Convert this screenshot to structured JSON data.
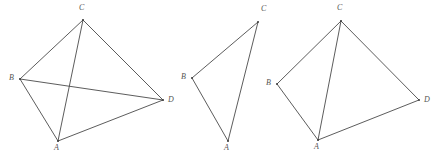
{
  "image": {
    "width": 442,
    "height": 158,
    "background_color": "#ffffff",
    "stroke_color": "#4a4a4a",
    "label_color": "#555555"
  },
  "figures": [
    {
      "id": "figure-1",
      "shape": "quadrilateral-with-two-diagonals",
      "vertices": [
        {
          "label": "C",
          "x": 83,
          "y": 20,
          "label_x": 79,
          "label_y": 4
        },
        {
          "label": "B",
          "x": 20,
          "y": 79,
          "label_x": 9,
          "label_y": 74
        },
        {
          "label": "D",
          "x": 163,
          "y": 100,
          "label_x": 168,
          "label_y": 96
        },
        {
          "label": "A",
          "x": 58,
          "y": 141,
          "label_x": 54,
          "label_y": 144
        }
      ],
      "edges": [
        {
          "from": "B",
          "to": "C",
          "kind": "side"
        },
        {
          "from": "C",
          "to": "D",
          "kind": "side"
        },
        {
          "from": "D",
          "to": "A",
          "kind": "side"
        },
        {
          "from": "A",
          "to": "B",
          "kind": "side"
        },
        {
          "from": "B",
          "to": "D",
          "kind": "diagonal"
        },
        {
          "from": "C",
          "to": "A",
          "kind": "diagonal"
        }
      ]
    },
    {
      "id": "figure-2",
      "shape": "triangle",
      "vertices": [
        {
          "label": "C",
          "x": 258,
          "y": 22,
          "label_x": 261,
          "label_y": 5
        },
        {
          "label": "B",
          "x": 192,
          "y": 78,
          "label_x": 181,
          "label_y": 73
        },
        {
          "label": "A",
          "x": 228,
          "y": 141,
          "label_x": 224,
          "label_y": 144
        }
      ],
      "edges": [
        {
          "from": "B",
          "to": "C",
          "kind": "side"
        },
        {
          "from": "B",
          "to": "A",
          "kind": "side"
        },
        {
          "from": "A",
          "to": "C",
          "kind": "side"
        }
      ]
    },
    {
      "id": "figure-3",
      "shape": "quadrilateral-with-one-diagonal",
      "vertices": [
        {
          "label": "C",
          "x": 341,
          "y": 21,
          "label_x": 337,
          "label_y": 4
        },
        {
          "label": "B",
          "x": 277,
          "y": 84,
          "label_x": 266,
          "label_y": 79
        },
        {
          "label": "D",
          "x": 419,
          "y": 100,
          "label_x": 424,
          "label_y": 96
        },
        {
          "label": "A",
          "x": 318,
          "y": 140,
          "label_x": 314,
          "label_y": 143
        }
      ],
      "edges": [
        {
          "from": "B",
          "to": "C",
          "kind": "side"
        },
        {
          "from": "C",
          "to": "D",
          "kind": "side"
        },
        {
          "from": "D",
          "to": "A",
          "kind": "side"
        },
        {
          "from": "A",
          "to": "B",
          "kind": "side"
        },
        {
          "from": "C",
          "to": "A",
          "kind": "diagonal"
        }
      ]
    }
  ]
}
